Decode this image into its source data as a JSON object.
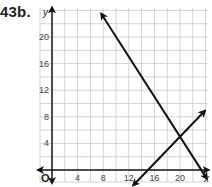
{
  "problem_label": "43b.",
  "chart_data": {
    "type": "line",
    "title": "",
    "xlabel": "x",
    "ylabel": "y",
    "origin_label": "O",
    "xlim": [
      0,
      24
    ],
    "ylim": [
      0,
      24
    ],
    "grid": true,
    "grid_step": 2,
    "x_ticks": [
      4,
      8,
      12,
      16,
      20
    ],
    "y_ticks": [
      4,
      8,
      12,
      16,
      20
    ],
    "series": [
      {
        "name": "line 1 (decreasing)",
        "equation": "y = -1.5x + 35",
        "points": [
          [
            7.7,
            23.5
          ],
          [
            24.2,
            -1.3
          ]
        ],
        "arrows": "both"
      },
      {
        "name": "line 2 (increasing)",
        "equation": "y = x - 15",
        "points": [
          [
            12.7,
            -2.3
          ],
          [
            23.9,
            8.9
          ]
        ],
        "arrows": "both"
      }
    ],
    "intersection": [
      20,
      5
    ]
  }
}
